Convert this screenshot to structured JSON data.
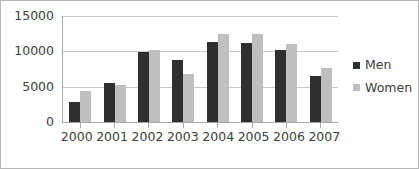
{
  "chart_data": {
    "type": "bar",
    "title": "",
    "subtitle": "",
    "xlabel": "",
    "ylabel": "",
    "categories": [
      "2000",
      "2001",
      "2002",
      "2003",
      "2004",
      "2005",
      "2006",
      "2007"
    ],
    "series": [
      {
        "name": "Men",
        "color": "#2f2f2f",
        "values": [
          2900,
          5500,
          9900,
          8800,
          11300,
          11200,
          10200,
          6500
        ]
      },
      {
        "name": "Women",
        "color": "#bfbfbf",
        "values": [
          4400,
          5300,
          10200,
          6800,
          12500,
          12500,
          11000,
          7700
        ]
      }
    ],
    "ylim": [
      0,
      15000
    ],
    "y_ticks": [
      0,
      5000,
      10000,
      15000
    ],
    "y_tick_labels": [
      "0",
      "5000",
      "10000",
      "15000"
    ],
    "grid": true,
    "grid_axis": "y",
    "legend_position": "right",
    "legend_entries": [
      "Men",
      "Women"
    ]
  },
  "frame": {
    "border_color": "#b6b6b6",
    "background": "#ffffff",
    "gridline_color": "#c9c9c9",
    "axis_color": "#a8a8a8",
    "text_color": "#404040"
  }
}
